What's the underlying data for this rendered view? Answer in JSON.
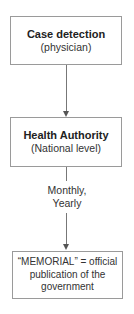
{
  "diagram": {
    "type": "flowchart",
    "nodes": [
      {
        "id": "case_detection",
        "title": "Case detection",
        "subtitle": "(physician)"
      },
      {
        "id": "health_authority",
        "title": "Health Authority",
        "subtitle": "(National level)"
      },
      {
        "id": "memorial",
        "lines": [
          "“MEMORIAL” = official",
          "publication of the",
          "government"
        ]
      }
    ],
    "edges": [
      {
        "from": "case_detection",
        "to": "health_authority",
        "label": ""
      },
      {
        "from": "health_authority",
        "to": "memorial",
        "label_lines": [
          "Monthly,",
          "Yearly"
        ]
      }
    ]
  },
  "colors": {
    "border": "#9a9a9a",
    "line": "#777777",
    "text": "#222222"
  }
}
